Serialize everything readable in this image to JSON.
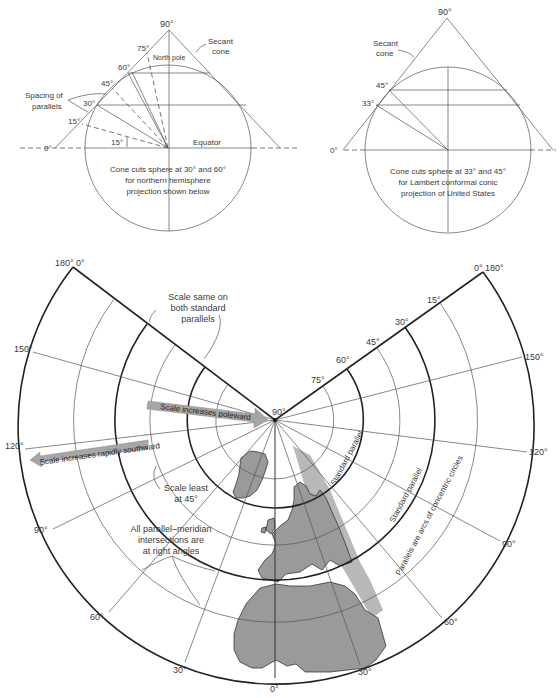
{
  "top_left_diagram": {
    "apex_label": "90°",
    "parallel_labels": [
      "75°",
      "60°",
      "45°",
      "30°",
      "15°",
      "0°"
    ],
    "angle_label": "15°",
    "north_pole_label": "North pole",
    "secant_cone_label_1": "Secant",
    "secant_cone_label_2": "cone",
    "spacing_label_1": "Spacing of",
    "spacing_label_2": "parallels",
    "equator_label": "Equator",
    "caption_1": "Cone cuts sphere at 30° and 60°",
    "caption_2": "for northern hemisphere",
    "caption_3": "projection shown below"
  },
  "top_right_diagram": {
    "apex_label": "90°",
    "parallel_labels": [
      "45°",
      "33°",
      "0°"
    ],
    "secant_cone_label_1": "Secant",
    "secant_cone_label_2": "cone",
    "caption_1": "Cone cuts sphere at 33° and 45°",
    "caption_2": "for Lambert conformal conic",
    "caption_3": "projection of United States"
  },
  "conic_map": {
    "pole_label": "90°",
    "left_apex_label": "180° 0°",
    "right_apex_label": "0° 180°",
    "parallel_labels": [
      "75°",
      "60°",
      "45°",
      "30°",
      "15°"
    ],
    "left_meridian_labels": [
      "150°",
      "120°",
      "90°",
      "60°",
      "30°"
    ],
    "right_meridian_labels": [
      "150°",
      "120°",
      "90°",
      "60°",
      "30°"
    ],
    "bottom_label": "0°",
    "annotations": {
      "scale_same_1": "Scale same on",
      "scale_same_2": "both standard",
      "scale_same_3": "parallels",
      "scale_least_1": "Scale least",
      "scale_least_2": "at 45°",
      "right_angles_1": "All parallel–meridian",
      "right_angles_2": "intersections are",
      "right_angles_3": "at right angles",
      "standard_parallel_inner": "Standard parallel",
      "standard_parallel_outer": "Standard parallel",
      "concentric": "Parallels are arcs of concentric circles"
    },
    "arrows": {
      "poleward": "Scale increases poleward",
      "southward": "Scale increases rapidly southward"
    },
    "colors": {
      "land": "#9a9a9a",
      "wedge": "#b8b8b8",
      "arrow": "#a6a6a6",
      "line": "#333333"
    }
  }
}
